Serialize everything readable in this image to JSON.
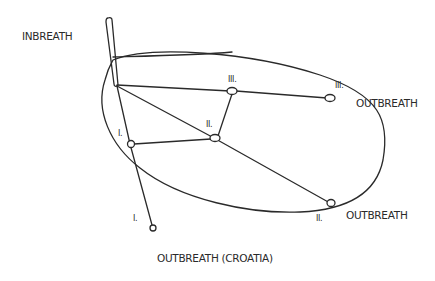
{
  "diagram": {
    "labels": {
      "inbreath": "INBREATH",
      "outbreath_iii": "OUTBREATH",
      "outbreath_ii": "OUTBREATH",
      "outbreath_croatia": "OUTBREATH (CROATIA)"
    },
    "numerals": {
      "node_i": "I.",
      "node_ii": "II.",
      "node_iii": "III.",
      "end_i": "I.",
      "end_ii": "II.",
      "end_iii": "III."
    },
    "colors": {
      "ink": "#2a2a2a",
      "paper": "#ffffff"
    }
  }
}
